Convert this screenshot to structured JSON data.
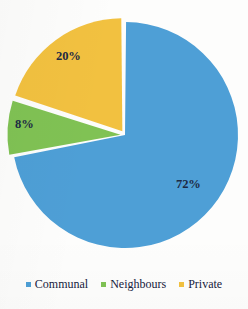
{
  "chart_data": {
    "type": "pie",
    "title": "",
    "subtitle": "",
    "xlabel": "",
    "ylabel": "",
    "categories": [
      "Communal",
      "Neighbours",
      "Private"
    ],
    "values": [
      72,
      8,
      20
    ],
    "data_labels": [
      "72%",
      "8%",
      "20%"
    ],
    "colors": [
      "#4e9fd6",
      "#80c254",
      "#f2c140"
    ],
    "label_color": "#1d2a44",
    "legend_position": "bottom",
    "grid": false,
    "start_angle_deg": 0,
    "direction": "clockwise",
    "exploded_slices": [
      "Neighbours",
      "Private"
    ],
    "slice_gap": "white",
    "units": "percent"
  },
  "labels": {
    "communal": "72%",
    "neighbours": "8%",
    "private": "20%"
  },
  "legend": {
    "items": [
      {
        "label": "Communal",
        "color": "#4e9fd6",
        "marker": "square-marker-icon"
      },
      {
        "label": "Neighbours",
        "color": "#80c254",
        "marker": "square-marker-icon"
      },
      {
        "label": "Private",
        "color": "#f2c140",
        "marker": "square-marker-icon"
      }
    ]
  }
}
